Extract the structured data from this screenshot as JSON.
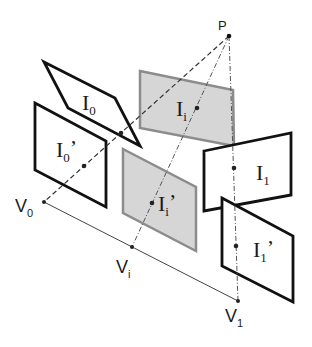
{
  "diagram": {
    "point_label": "P",
    "views": {
      "I0": {
        "main": "I",
        "sub": "0",
        "prime": ""
      },
      "I0p": {
        "main": "I",
        "sub": "0",
        "prime": "’"
      },
      "Ii": {
        "main": "I",
        "sub": "i",
        "prime": ""
      },
      "Iip": {
        "main": "I",
        "sub": "i",
        "prime": "’"
      },
      "I1": {
        "main": "I",
        "sub": "1",
        "prime": ""
      },
      "I1p": {
        "main": "I",
        "sub": "1",
        "prime": "’"
      }
    },
    "vertices": {
      "V0": {
        "main": "V",
        "sub": "0"
      },
      "Vi": {
        "main": "V",
        "sub": "i"
      },
      "V1": {
        "main": "V",
        "sub": "1"
      }
    },
    "colors": {
      "frame_stroke": "#111111",
      "interp_fill": "#d6d6d6",
      "interp_stroke": "#8c8c8c",
      "line": "#333333"
    }
  }
}
